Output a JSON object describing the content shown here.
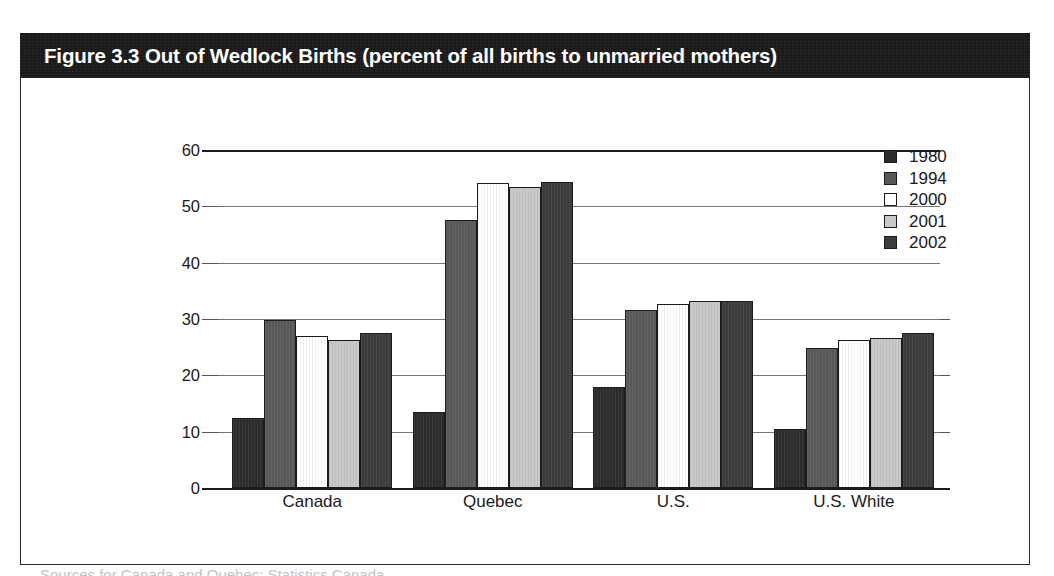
{
  "figure": {
    "title": "Figure 3.3 Out of Wedlock Births (percent of all births to unmarried mothers)",
    "bottom_caption": "Sources for Canada and Quebec: Statistics Canada"
  },
  "chart_data": {
    "type": "bar",
    "title": "Figure 3.3 Out of Wedlock Births (percent of all births to unmarried mothers)",
    "xlabel": "",
    "ylabel": "",
    "ylim": [
      0,
      60
    ],
    "yticks": [
      0,
      10,
      20,
      30,
      40,
      50,
      60
    ],
    "grid": true,
    "legend_position": "top-right",
    "categories": [
      "Canada",
      "Quebec",
      "U.S.",
      "U.S. White"
    ],
    "series": [
      {
        "name": "1980",
        "color": "#2b2b2b",
        "values": [
          12.5,
          13.5,
          18.0,
          10.5
        ]
      },
      {
        "name": "1994",
        "color": "#585858",
        "values": [
          29.8,
          47.5,
          31.6,
          24.8
        ]
      },
      {
        "name": "2000",
        "color": "#ffffff",
        "values": [
          27.0,
          54.2,
          32.7,
          26.3
        ]
      },
      {
        "name": "2001",
        "color": "#c9c9c9",
        "values": [
          26.2,
          53.5,
          33.2,
          26.6
        ]
      },
      {
        "name": "2002",
        "color": "#3b3b3b",
        "values": [
          27.5,
          54.3,
          33.2,
          27.5
        ]
      }
    ]
  },
  "legend": {
    "items": [
      {
        "label": "1980",
        "color": "#2b2b2b"
      },
      {
        "label": "1994",
        "color": "#585858"
      },
      {
        "label": "2000",
        "color": "#ffffff"
      },
      {
        "label": "2001",
        "color": "#c9c9c9"
      },
      {
        "label": "2002",
        "color": "#3b3b3b"
      }
    ]
  },
  "axis": {
    "y_tick_labels": [
      "60",
      "50",
      "40",
      "30",
      "20",
      "10",
      "0"
    ],
    "x_tick_labels": [
      "Canada",
      "Quebec",
      "U.S.",
      "U.S. White"
    ]
  }
}
